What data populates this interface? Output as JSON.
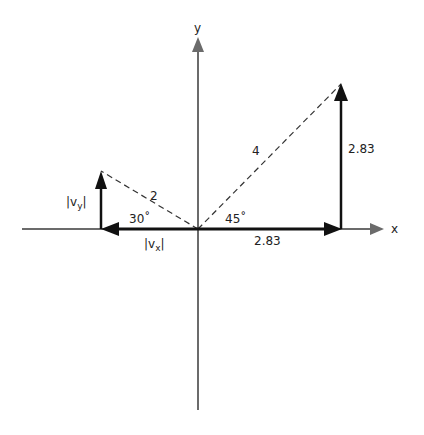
{
  "axes": {
    "x_label": "x",
    "y_label": "y",
    "axis_color": "#6b6b6b"
  },
  "vector_right": {
    "magnitude_label": "4",
    "angle_label": "45˚",
    "x_component_label": "2.83",
    "y_component_label": "2.83"
  },
  "vector_left": {
    "magnitude_label": "2",
    "angle_label": "30˚",
    "x_component_prefix": "|v",
    "x_component_sub": "x",
    "x_component_suffix": "|",
    "y_component_prefix": "|v",
    "y_component_sub": "y",
    "y_component_suffix": "|"
  },
  "colors": {
    "component_arrow": "#111111",
    "dashed_line": "#333333"
  }
}
